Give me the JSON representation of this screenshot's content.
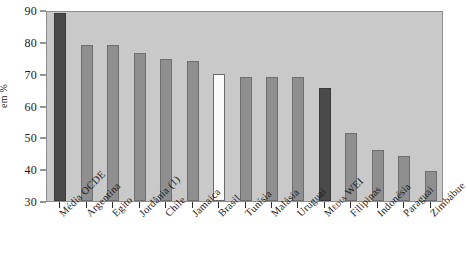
{
  "chart_data": {
    "type": "bar",
    "title": "",
    "subtitle": "",
    "xlabel": "",
    "ylabel": "em %",
    "ylim": [
      30,
      90
    ],
    "yticks": [
      30,
      40,
      50,
      60,
      70,
      80,
      90
    ],
    "grid": false,
    "legend": "none",
    "categories": [
      "Média OCDE",
      "Argentina",
      "Egito",
      "Jordânia (1)",
      "Chile",
      "Jamaica",
      "Brasil",
      "Tunísia",
      "Malásia",
      "Uruguai",
      "Média WEI",
      "Filipinas",
      "Indonésia",
      "Paraguai",
      "Zimbábue"
    ],
    "values": [
      89,
      79,
      79,
      76.5,
      74.5,
      74,
      70,
      69,
      69,
      69,
      65.5,
      51.5,
      46,
      44,
      39.5
    ],
    "bar_shades": [
      "dark",
      "mid",
      "mid",
      "mid",
      "mid",
      "mid",
      "light",
      "mid",
      "mid",
      "mid",
      "dark",
      "mid",
      "mid",
      "mid",
      "mid"
    ],
    "colors": {
      "plot_background": "#c9c9c9",
      "bar_dark": "#4a4a4a",
      "bar_mid": "#8f8f8f",
      "bar_light": "#fbfbfb",
      "bar_outline": "#6b6b6b",
      "axis": "#2b2b2b",
      "frame": "#8d8d8d",
      "page_background": "#ffffff",
      "text": "#1a1a1a"
    }
  }
}
